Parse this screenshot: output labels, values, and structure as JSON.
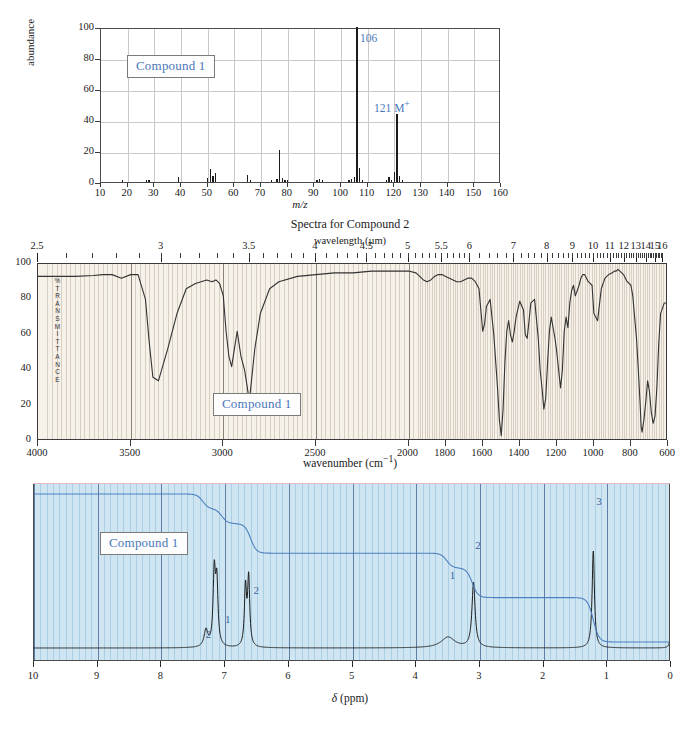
{
  "figure": {
    "title": "Spectra for Compound 2",
    "compound_tag": "Compound 1"
  },
  "mass_spectrum": {
    "ylabel": "abundance",
    "xlabel": "m/z",
    "annotation_base": "106",
    "annotation_molecular_ion": "121 M",
    "annotation_molecular_ion_sup": "+",
    "y_ticks": [
      "100",
      "80",
      "60",
      "40",
      "20",
      "0"
    ],
    "x_ticks": [
      "10",
      "20",
      "30",
      "40",
      "50",
      "60",
      "70",
      "80",
      "90",
      "100",
      "110",
      "120",
      "130",
      "140",
      "150",
      "160"
    ]
  },
  "ir_spectrum": {
    "top_axis_label": "wavelength (µm)",
    "y_axis_label_chars": [
      "%",
      "T",
      "R",
      "A",
      "N",
      "S",
      "M",
      "I",
      "T",
      "T",
      "A",
      "N",
      "C",
      "E"
    ],
    "xlabel_main": "wavenumber (cm",
    "xlabel_sup": "−1",
    "xlabel_close": ")",
    "y_ticks": [
      "100",
      "80",
      "60",
      "40",
      "20",
      "0"
    ],
    "x_ticks": [
      "4000",
      "3500",
      "3000",
      "2500",
      "2000",
      "1800",
      "1600",
      "1400",
      "1200",
      "1000",
      "800",
      "600"
    ],
    "wavelength_ticks": [
      "2.5",
      "3",
      "3.5",
      "4",
      "4.5",
      "5",
      "5.5",
      "6",
      "7",
      "8",
      "9",
      "10",
      "11",
      "12",
      "13",
      "14",
      "15",
      "16"
    ]
  },
  "nmr_spectrum": {
    "xlabel_delta": "δ",
    "xlabel_units": "(ppm)",
    "x_ticks": [
      "10",
      "9",
      "8",
      "7",
      "6",
      "5",
      "4",
      "3",
      "2",
      "1",
      "0"
    ],
    "integration_labels": [
      "2",
      "1",
      "2",
      "3"
    ]
  },
  "chart_data": [
    {
      "type": "bar",
      "name": "mass-spectrum",
      "title": "",
      "xlabel": "m/z",
      "ylabel": "abundance",
      "xlim": [
        10,
        160
      ],
      "ylim": [
        0,
        100
      ],
      "grid": true,
      "x": [
        18,
        27,
        28,
        39,
        50,
        51,
        52,
        53,
        65,
        66,
        74,
        76,
        77,
        78,
        79,
        80,
        91,
        92,
        93,
        103,
        104,
        105,
        106,
        107,
        108,
        117,
        118,
        119,
        120,
        121,
        122,
        123
      ],
      "values": [
        1.5,
        1.2,
        1.5,
        3.5,
        2.5,
        8.5,
        4.0,
        5.5,
        4.5,
        1.0,
        1.0,
        2.0,
        20.5,
        2.5,
        1.5,
        1.0,
        1.5,
        2.0,
        1.5,
        1.5,
        2.0,
        3.0,
        100,
        9.0,
        1.5,
        1.0,
        3.0,
        1.5,
        6.5,
        44,
        4.0,
        1.0
      ],
      "annotations": [
        {
          "text": "106",
          "x": 106,
          "y": 92
        },
        {
          "text": "121 M+",
          "x": 121,
          "y": 50
        }
      ]
    },
    {
      "type": "line",
      "name": "ir-spectrum",
      "title": "Spectra for Compound 2",
      "xlabel": "wavenumber (cm−1)",
      "ylabel": "% TRANSMITTANCE",
      "xlim": [
        4000,
        600
      ],
      "ylim": [
        0,
        100
      ],
      "grid": true,
      "secondary_xlabel": "wavelength (µm)",
      "x": [
        4000,
        3900,
        3800,
        3700,
        3650,
        3600,
        3550,
        3500,
        3460,
        3420,
        3400,
        3380,
        3350,
        3300,
        3250,
        3200,
        3150,
        3120,
        3090,
        3060,
        3040,
        3020,
        3000,
        2985,
        2970,
        2955,
        2940,
        2925,
        2905,
        2885,
        2870,
        2860,
        2850,
        2830,
        2800,
        2750,
        2700,
        2600,
        2500,
        2400,
        2300,
        2200,
        2100,
        2000,
        1960,
        1940,
        1920,
        1900,
        1880,
        1860,
        1840,
        1820,
        1800,
        1780,
        1760,
        1740,
        1720,
        1700,
        1680,
        1660,
        1640,
        1620,
        1610,
        1600,
        1590,
        1580,
        1560,
        1540,
        1520,
        1510,
        1500,
        1490,
        1480,
        1470,
        1460,
        1450,
        1440,
        1430,
        1420,
        1400,
        1380,
        1370,
        1360,
        1340,
        1320,
        1300,
        1290,
        1280,
        1270,
        1260,
        1250,
        1240,
        1230,
        1220,
        1210,
        1200,
        1180,
        1170,
        1160,
        1150,
        1140,
        1130,
        1120,
        1110,
        1100,
        1080,
        1070,
        1060,
        1050,
        1040,
        1030,
        1010,
        1000,
        980,
        960,
        940,
        920,
        900,
        890,
        880,
        870,
        860,
        850,
        840,
        830,
        820,
        800,
        790,
        780,
        770,
        760,
        750,
        745,
        740,
        730,
        720,
        710,
        700,
        690,
        680,
        670,
        660,
        650,
        640,
        620,
        600
      ],
      "values": [
        93,
        93,
        93,
        93.5,
        94,
        94,
        92,
        94,
        94,
        80,
        56,
        36,
        34,
        52,
        72,
        86,
        89,
        90,
        91,
        90,
        91,
        89,
        82,
        62,
        48,
        42,
        52,
        62,
        48,
        40,
        30,
        22,
        32,
        52,
        72,
        86,
        90,
        93,
        94,
        95,
        95,
        96,
        96,
        96,
        95,
        93,
        91,
        90,
        91,
        93,
        94,
        94,
        93,
        92,
        91,
        90,
        90,
        91,
        92,
        92,
        90,
        86,
        74,
        62,
        66,
        76,
        80,
        60,
        30,
        12,
        3,
        18,
        45,
        62,
        68,
        60,
        56,
        62,
        70,
        79,
        74,
        60,
        58,
        78,
        80,
        58,
        40,
        30,
        18,
        24,
        44,
        62,
        70,
        64,
        58,
        50,
        30,
        40,
        62,
        70,
        64,
        78,
        85,
        88,
        82,
        88,
        92,
        94,
        94,
        92,
        90,
        88,
        72,
        68,
        86,
        92,
        94,
        95,
        96,
        96,
        97,
        96,
        95,
        94,
        92,
        90,
        88,
        82,
        70,
        58,
        40,
        20,
        8,
        5,
        12,
        22,
        34,
        28,
        16,
        10,
        14,
        30,
        55,
        72,
        78,
        78,
        76,
        78,
        74,
        71,
        88
      ]
    },
    {
      "type": "line",
      "name": "nmr-spectrum",
      "xlabel": "δ (ppm)",
      "ylabel": "",
      "xlim": [
        10,
        0
      ],
      "ylim": [
        0,
        100
      ],
      "grid": true,
      "peaks": [
        {
          "shift": 7.3,
          "height": 11,
          "width": 0.035,
          "integration": 2
        },
        {
          "shift": 7.17,
          "height": 47,
          "width": 0.022
        },
        {
          "shift": 7.13,
          "height": 40,
          "width": 0.022
        },
        {
          "shift": 6.68,
          "height": 38,
          "width": 0.02
        },
        {
          "shift": 6.63,
          "height": 44,
          "width": 0.02
        },
        {
          "shift": 3.5,
          "height": 7,
          "width": 0.13,
          "integration": 1
        },
        {
          "shift": 3.1,
          "height": 42,
          "width": 0.03,
          "integration": 2
        },
        {
          "shift": 1.22,
          "height": 63,
          "width": 0.022,
          "integration": 3
        },
        {
          "shift": 0.0,
          "height": 15,
          "width": 0.015
        }
      ],
      "integration_steps": [
        {
          "label": "2",
          "shift": 7.35,
          "rise": 7
        },
        {
          "label": "1",
          "shift": 7.05,
          "rise": 7
        },
        {
          "label": "2",
          "shift": 6.6,
          "rise": 14
        },
        {
          "label": "1",
          "shift": 3.52,
          "rise": 7
        },
        {
          "label": "2",
          "shift": 3.12,
          "rise": 14
        },
        {
          "label": "3",
          "shift": 1.22,
          "rise": 21
        }
      ]
    }
  ]
}
